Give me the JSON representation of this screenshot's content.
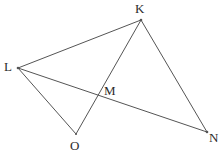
{
  "figure": {
    "type": "line-diagram",
    "canvas": {
      "width": 224,
      "height": 166,
      "background": "#ffffff"
    },
    "stroke_color": "#555555",
    "stroke_width": 1,
    "label_color": "#2b2b2b",
    "points": [
      {
        "id": "K",
        "label": "K",
        "x": 141,
        "y": 20,
        "label_x": 135,
        "label_y": 2
      },
      {
        "id": "L",
        "label": "L",
        "x": 18,
        "y": 68,
        "label_x": 4,
        "label_y": 60
      },
      {
        "id": "M",
        "label": "M",
        "x": 99,
        "y": 96,
        "label_x": 104,
        "label_y": 84
      },
      {
        "id": "O",
        "label": "O",
        "x": 76,
        "y": 134,
        "label_x": 70,
        "label_y": 139
      },
      {
        "id": "N",
        "label": "N",
        "x": 207,
        "y": 132,
        "label_x": 209,
        "label_y": 131
      }
    ],
    "segments": [
      {
        "id": "LK",
        "from": "L",
        "to": "K"
      },
      {
        "id": "LN",
        "from": "L",
        "to": "N"
      },
      {
        "id": "LO",
        "from": "L",
        "to": "O"
      },
      {
        "id": "KN",
        "from": "K",
        "to": "N"
      },
      {
        "id": "KO",
        "from": "K",
        "to": "O"
      }
    ],
    "labels": {
      "K": "K",
      "L": "L",
      "M": "M",
      "O": "O",
      "N": "N"
    }
  }
}
